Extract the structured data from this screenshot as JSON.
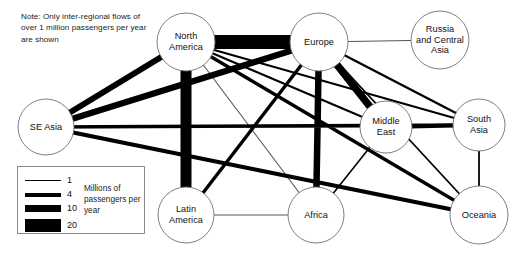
{
  "note": "Note: Only inter-regional flows of over 1 million passengers per year are shown",
  "legend": {
    "caption": "Millions of passengers per year",
    "entries": [
      {
        "value": "1",
        "thickness": 1
      },
      {
        "value": "4",
        "thickness": 4
      },
      {
        "value": "10",
        "thickness": 7
      },
      {
        "value": "20",
        "thickness": 13
      }
    ]
  },
  "chart_data": {
    "type": "diagram",
    "units": "millions of passengers per year",
    "nodes": [
      {
        "id": "north_america",
        "label": "North\nAmerica",
        "x": 186,
        "y": 42,
        "r": 29
      },
      {
        "id": "europe",
        "label": "Europe",
        "x": 319,
        "y": 42,
        "r": 29
      },
      {
        "id": "russia",
        "label": "Russia\nand Central\nAsia",
        "x": 440,
        "y": 40,
        "r": 29
      },
      {
        "id": "se_asia",
        "label": "SE Asia",
        "x": 46,
        "y": 127,
        "r": 28
      },
      {
        "id": "middle_east",
        "label": "Middle\nEast",
        "x": 386,
        "y": 127,
        "r": 26
      },
      {
        "id": "south_asia",
        "label": "South\nAsia",
        "x": 479,
        "y": 125,
        "r": 26
      },
      {
        "id": "latin_america",
        "label": "Latin\nAmerica",
        "x": 186,
        "y": 215,
        "r": 28
      },
      {
        "id": "africa",
        "label": "Africa",
        "x": 316,
        "y": 215,
        "r": 28
      },
      {
        "id": "oceania",
        "label": "Oceania",
        "x": 479,
        "y": 215,
        "r": 29
      }
    ],
    "edges": [
      {
        "source": "north_america",
        "target": "europe",
        "value": 22,
        "width": 14
      },
      {
        "source": "north_america",
        "target": "latin_america",
        "value": 15,
        "width": 11
      },
      {
        "source": "north_america",
        "target": "se_asia",
        "value": 7,
        "width": 6
      },
      {
        "source": "north_america",
        "target": "middle_east",
        "value": 2,
        "width": 2
      },
      {
        "source": "north_america",
        "target": "south_asia",
        "value": 2,
        "width": 2
      },
      {
        "source": "north_america",
        "target": "oceania",
        "value": 4,
        "width": 3.4
      },
      {
        "source": "north_america",
        "target": "africa",
        "value": 1,
        "width": 1.1
      },
      {
        "source": "europe",
        "target": "russia",
        "value": 1,
        "width": 1.1
      },
      {
        "source": "europe",
        "target": "middle_east",
        "value": 10,
        "width": 7.5
      },
      {
        "source": "europe",
        "target": "africa",
        "value": 9,
        "width": 6.5
      },
      {
        "source": "europe",
        "target": "se_asia",
        "value": 8,
        "width": 6.2
      },
      {
        "source": "europe",
        "target": "latin_america",
        "value": 4,
        "width": 3.4
      },
      {
        "source": "europe",
        "target": "south_asia",
        "value": 3,
        "width": 2.4
      },
      {
        "source": "europe",
        "target": "oceania",
        "value": 2,
        "width": 1.8
      },
      {
        "source": "se_asia",
        "target": "middle_east",
        "value": 1,
        "width": 1.1
      },
      {
        "source": "se_asia",
        "target": "oceania",
        "value": 5,
        "width": 4.2
      },
      {
        "source": "se_asia",
        "target": "south_asia",
        "value": 4,
        "width": 3.4
      },
      {
        "source": "middle_east",
        "target": "south_asia",
        "value": 5,
        "width": 4.2
      },
      {
        "source": "middle_east",
        "target": "africa",
        "value": 2,
        "width": 1.6
      },
      {
        "source": "south_asia",
        "target": "oceania",
        "value": 2,
        "width": 1.8
      },
      {
        "source": "latin_america",
        "target": "africa",
        "value": 1,
        "width": 1.1
      }
    ]
  }
}
